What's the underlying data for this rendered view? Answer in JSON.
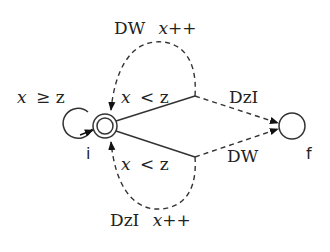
{
  "diagram": {
    "type": "state-machine",
    "states": [
      {
        "id": "i",
        "label": "i",
        "initial": false,
        "accepting": true,
        "shape": "double-circle"
      },
      {
        "id": "f",
        "label": "f",
        "accepting": false,
        "shape": "circle"
      }
    ],
    "transitions": [
      {
        "from": "i",
        "to": "i",
        "guard": "x ≥ z",
        "style": "solid",
        "kind": "self-loop"
      },
      {
        "from": "i",
        "to": "i",
        "guard": "x < z",
        "action": "DW x++",
        "style": "solid-then-dashed",
        "branch": "upper"
      },
      {
        "from": "i",
        "to": "f",
        "guard": "x < z",
        "action": "DzI",
        "style": "solid-then-dashed",
        "branch": "upper"
      },
      {
        "from": "i",
        "to": "i",
        "guard": "x < z",
        "action": "DzI x++",
        "style": "solid-then-dashed",
        "branch": "lower"
      },
      {
        "from": "i",
        "to": "f",
        "guard": "x < z",
        "action": "DW",
        "style": "solid-then-dashed",
        "branch": "lower"
      }
    ],
    "labels": {
      "self_loop_guard_x": "x",
      "self_loop_guard_rest": "≥ z",
      "upper_guard_x": "x",
      "upper_guard_rest": "< z",
      "lower_guard_x": "x",
      "lower_guard_rest": "< z",
      "top_action_name": "DW",
      "top_action_update": "x++",
      "bottom_action_name": "DzI",
      "bottom_action_update": "x++",
      "upper_to_f": "DzI",
      "lower_to_f": "DW",
      "state_i": "i",
      "state_f": "f"
    }
  }
}
